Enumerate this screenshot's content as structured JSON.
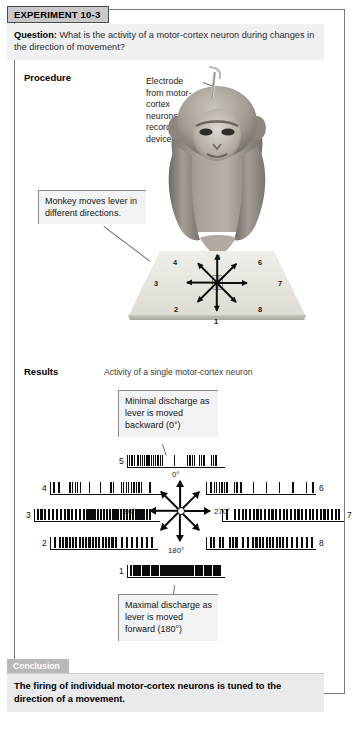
{
  "experiment": {
    "label": "EXPERIMENT 10-3",
    "question_prefix": "Question:",
    "question_text": " What is the activity of a motor-cortex neuron during changes in the direction of movement?"
  },
  "procedure": {
    "label": "Procedure",
    "electrode_callout": "Electrode from motor-cortex neurons to recording device",
    "lever_callout": "Monkey moves lever in different directions.",
    "platform_numbers": [
      "1",
      "2",
      "3",
      "4",
      "5",
      "6",
      "7",
      "8"
    ]
  },
  "results": {
    "label": "Results",
    "subtitle": "Activity of a single motor-cortex neuron",
    "minimal_callout": "Minimal discharge as lever is moved backward (0°)",
    "maximal_callout": "Maximal discharge as lever is moved forward (180°)",
    "angles": [
      "0°",
      "90°",
      "270°",
      "180°"
    ]
  },
  "conclusion": {
    "tab": "Conclusion",
    "text": "The firing of individual motor-cortex neurons is tuned to the direction of a movement."
  },
  "chart_data": {
    "type": "raster",
    "title": "Activity of a single motor-cortex neuron",
    "xlabel": "Time",
    "ylabel": "Spike events",
    "direction_angles_deg": {
      "1": 180,
      "2": 135,
      "3": 90,
      "4": 45,
      "5": 0,
      "6": 315,
      "7": 270,
      "8": 225
    },
    "labeled_angles": [
      "0°",
      "90°",
      "180°",
      "270°"
    ],
    "tuning_note": "Maximal discharge at 180° (trace 1, forward); minimal discharge at 0° (trace 5, backward).",
    "traces": [
      {
        "id": "5",
        "angle_deg": 0,
        "position": "top",
        "density": "minimal",
        "relative_rate": 0.3,
        "spikes": [
          2,
          5,
          8,
          13,
          16,
          19,
          22,
          25,
          28,
          31,
          34,
          37,
          40,
          43,
          46,
          62,
          80,
          83,
          86,
          89,
          96,
          99,
          102,
          112,
          115,
          118
        ]
      },
      {
        "id": "4",
        "angle_deg": 45,
        "position": "upper-left",
        "density": "low",
        "relative_rate": 0.38,
        "spikes": [
          3,
          9,
          22,
          25,
          28,
          31,
          34,
          45,
          58,
          70,
          73,
          82,
          85,
          88,
          91,
          94,
          97,
          100,
          103,
          106,
          116
        ]
      },
      {
        "id": "6",
        "angle_deg": 315,
        "position": "upper-right",
        "density": "low",
        "relative_rate": 0.33,
        "spikes": [
          4,
          8,
          11,
          14,
          17,
          20,
          23,
          32,
          35,
          40,
          55,
          70,
          86,
          102,
          118,
          126
        ]
      },
      {
        "id": "3",
        "angle_deg": 90,
        "position": "left",
        "density": "high",
        "relative_rate": 0.82,
        "spikes": [
          2,
          6,
          10,
          14,
          18,
          22,
          26,
          30,
          34,
          38,
          42,
          46,
          50,
          53,
          56,
          59,
          62,
          65,
          68,
          71,
          74,
          77,
          80,
          83,
          86,
          89,
          92,
          95,
          98,
          101,
          104,
          107,
          110,
          113,
          116,
          119
        ]
      },
      {
        "id": "7",
        "angle_deg": 270,
        "position": "right",
        "density": "high",
        "relative_rate": 0.8,
        "spikes": [
          3,
          12,
          16,
          20,
          24,
          28,
          32,
          36,
          40,
          44,
          48,
          52,
          56,
          60,
          64,
          68,
          72,
          76,
          80,
          84,
          88,
          92,
          96,
          100,
          104,
          108,
          112,
          116,
          120,
          124
        ]
      },
      {
        "id": "2",
        "angle_deg": 135,
        "position": "lower-left",
        "density": "high",
        "relative_rate": 0.76,
        "spikes": [
          4,
          10,
          14,
          18,
          22,
          26,
          30,
          34,
          38,
          42,
          46,
          50,
          54,
          58,
          62,
          66,
          70,
          74,
          78,
          86,
          92,
          98,
          104,
          110,
          116,
          122
        ]
      },
      {
        "id": "8",
        "angle_deg": 225,
        "position": "lower-right",
        "density": "high",
        "relative_rate": 0.74,
        "spikes": [
          3,
          7,
          14,
          18,
          26,
          30,
          34,
          42,
          48,
          54,
          58,
          62,
          66,
          70,
          74,
          78,
          82,
          86,
          90,
          94,
          100,
          106,
          112,
          118,
          124
        ]
      },
      {
        "id": "1",
        "angle_deg": 180,
        "position": "bottom",
        "density": "maximal",
        "relative_rate": 0.95,
        "spikes": [
          3,
          7,
          11,
          15,
          19,
          23,
          27,
          31,
          35,
          39,
          43,
          47,
          51,
          55,
          59,
          63,
          67,
          71,
          75,
          79,
          83,
          87,
          91,
          95,
          99,
          103,
          107,
          111,
          115,
          119,
          123
        ]
      }
    ]
  }
}
